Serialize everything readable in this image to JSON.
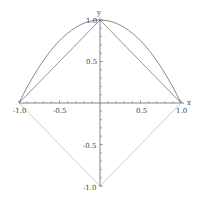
{
  "chart_data": {
    "type": "line",
    "title": "",
    "xlabel": "x",
    "ylabel": "y",
    "xlim": [
      -1.0,
      1.0
    ],
    "ylim": [
      -1.0,
      1.0
    ],
    "grid": false,
    "legend": null,
    "x_ticks": [
      "-1.0",
      "-0.5",
      "0.5",
      "1.0"
    ],
    "y_ticks": [
      "1.0",
      "0.5",
      "-0.5",
      "-1.0"
    ],
    "series": [
      {
        "name": "parabola",
        "function": "y = 1 - x^2",
        "x": [
          -1.0,
          -0.75,
          -0.5,
          -0.25,
          0.0,
          0.25,
          0.5,
          0.75,
          1.0
        ],
        "y": [
          0.0,
          0.4375,
          0.75,
          0.9375,
          1.0,
          0.9375,
          0.75,
          0.4375,
          0.0
        ],
        "color": "#777777"
      },
      {
        "name": "upper-triangle",
        "x": [
          -1.0,
          0.0,
          1.0
        ],
        "y": [
          0.0,
          1.0,
          0.0
        ],
        "color": "#888888"
      },
      {
        "name": "lower-diamond",
        "x": [
          -1.0,
          0.0,
          1.0
        ],
        "y": [
          0.0,
          -1.0,
          0.0
        ],
        "color": "#c8c8c8"
      }
    ]
  },
  "axes": {
    "x_label": "x",
    "y_label": "y",
    "x_tick_labels": [
      "-1.0",
      "-0.5",
      "0.5",
      "1.0"
    ],
    "y_tick_labels": [
      "1.0",
      "0.5",
      "-0.5",
      "-1.0"
    ]
  }
}
